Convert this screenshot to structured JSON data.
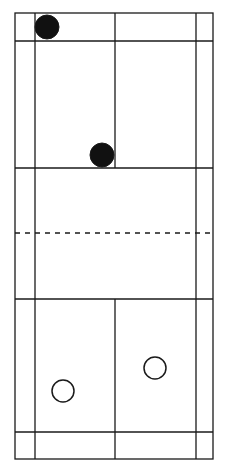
{
  "diagram": {
    "type": "badminton-court-doubles-positions",
    "colors": {
      "background": "#ffffff",
      "line": "#1a1a1a",
      "player_fill": "#111111"
    },
    "court": {
      "outer": {
        "x1": 15,
        "y1": 13,
        "x2": 213,
        "y2": 459
      },
      "singles_sidelines_x": [
        35,
        196
      ],
      "center_line_x": 115,
      "top_long_service_line_y": 41,
      "top_short_service_line_y": 168,
      "net_y": 233,
      "bottom_short_service_line_y": 299,
      "bottom_long_service_line_y": 432
    },
    "players": [
      {
        "team": "A",
        "style": "filled",
        "cx": 47,
        "cy": 27,
        "r": 12
      },
      {
        "team": "A",
        "style": "filled",
        "cx": 102,
        "cy": 155,
        "r": 12
      },
      {
        "team": "B",
        "style": "open",
        "cx": 63,
        "cy": 391,
        "r": 11
      },
      {
        "team": "B",
        "style": "open",
        "cx": 155,
        "cy": 368,
        "r": 11
      }
    ]
  }
}
